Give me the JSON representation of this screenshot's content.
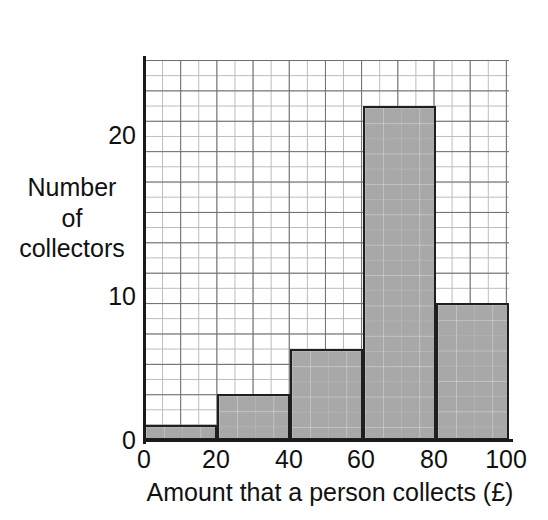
{
  "chart_data": {
    "type": "bar",
    "title": "",
    "subtitle": "",
    "xlabel": "Amount that a person collects (£)",
    "ylabel_lines": [
      "Number",
      "of",
      "collectors"
    ],
    "ylabel": "Number of collectors",
    "categories": [
      "0–20",
      "20–40",
      "40–60",
      "60–80",
      "80–100"
    ],
    "bin_edges": [
      0,
      20,
      40,
      60,
      80,
      100
    ],
    "values": [
      1,
      3,
      6,
      22,
      9
    ],
    "xlim": [
      0,
      100
    ],
    "ylim": [
      0,
      25
    ],
    "xticks": [
      "0",
      "20",
      "40",
      "60",
      "80",
      "100"
    ],
    "xtick_values": [
      0,
      20,
      40,
      60,
      80,
      100
    ],
    "yticks": [
      "0",
      "10",
      "20"
    ],
    "ytick_values": [
      0,
      10,
      20
    ],
    "grid": true,
    "grid_style": "graph-paper minor and major lines",
    "legend": "none",
    "bar_fill_color": "#a8a8a8",
    "bar_edge_color": "#1f1f1f",
    "grid_minor_color": "#b9b9b9",
    "grid_major_color": "#6e6e6e",
    "axis_color": "#1a1a1a",
    "background_color": "#ffffff"
  },
  "axis": {
    "y_tick_0": "0",
    "y_tick_10": "10",
    "y_tick_20": "20",
    "x_tick_0": "0",
    "x_tick_20": "20",
    "x_tick_40": "40",
    "x_tick_60": "60",
    "x_tick_80": "80",
    "x_tick_100": "100"
  },
  "labels": {
    "y_line_1": "Number",
    "y_line_2": "of",
    "y_line_3": "collectors",
    "x_title": "Amount that a person collects (£)"
  }
}
